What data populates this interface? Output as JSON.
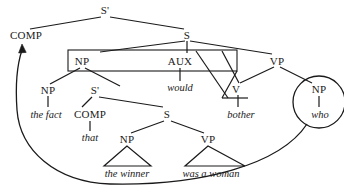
{
  "diagram": {
    "type": "linguistic-phrase-structure-tree",
    "ink_color": "#1a1a1a",
    "background_color": "#ffffff",
    "nodes": [
      {
        "id": "s-bar-top",
        "label": "S'",
        "x": 105,
        "y": 10,
        "kind": "category"
      },
      {
        "id": "comp-top",
        "label": "COMP",
        "x": 26,
        "y": 35,
        "kind": "category"
      },
      {
        "id": "s-main",
        "label": "S",
        "x": 187,
        "y": 35,
        "kind": "category"
      },
      {
        "id": "np-boxed",
        "label": "NP",
        "x": 82,
        "y": 61,
        "kind": "category"
      },
      {
        "id": "aux",
        "label": "AUX",
        "x": 180,
        "y": 61,
        "kind": "category"
      },
      {
        "id": "vp-main",
        "label": "VP",
        "x": 277,
        "y": 61,
        "kind": "category"
      },
      {
        "id": "np-the-fact",
        "label": "NP",
        "x": 48,
        "y": 90,
        "kind": "category"
      },
      {
        "id": "s-bar-embedded",
        "label": "S'",
        "x": 95,
        "y": 90,
        "kind": "category"
      },
      {
        "id": "v-bother",
        "label": "V",
        "x": 236,
        "y": 89,
        "kind": "category"
      },
      {
        "id": "np-who",
        "label": "NP",
        "x": 319,
        "y": 89,
        "kind": "category"
      },
      {
        "id": "comp-embedded",
        "label": "COMP",
        "x": 90,
        "y": 114,
        "kind": "category"
      },
      {
        "id": "s-embedded",
        "label": "S",
        "x": 167,
        "y": 114,
        "kind": "category"
      },
      {
        "id": "np-winner",
        "label": "NP",
        "x": 127,
        "y": 139,
        "kind": "category"
      },
      {
        "id": "vp-woman",
        "label": "VP",
        "x": 208,
        "y": 139,
        "kind": "category"
      }
    ],
    "terminals": [
      {
        "id": "the-fact",
        "label": "the fact",
        "x": 46,
        "y": 114
      },
      {
        "id": "that",
        "label": "that",
        "x": 90,
        "y": 137
      },
      {
        "id": "would",
        "label": "would",
        "x": 180,
        "y": 87
      },
      {
        "id": "bother",
        "label": "bother",
        "x": 241,
        "y": 114
      },
      {
        "id": "who",
        "label": "who",
        "x": 320,
        "y": 114
      },
      {
        "id": "the-winner",
        "label": "the winner",
        "x": 127,
        "y": 173
      },
      {
        "id": "was-a-woman",
        "label": "was a woman",
        "x": 211,
        "y": 173
      }
    ],
    "annotations": {
      "boxed_constituent": "NP ... AUX rectangle",
      "circled_constituent": "NP who",
      "movement_arrow": "curved arrow from circled NP who to COMP"
    }
  }
}
